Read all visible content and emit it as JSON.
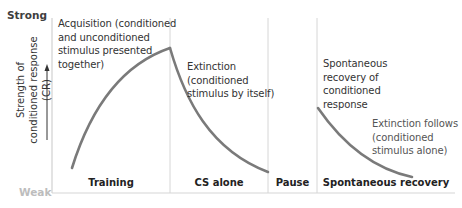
{
  "axis": {
    "top_label": "Strong",
    "bottom_label": "Weak",
    "y_label_line1": "Strength of",
    "y_label_line2": "conditioned response (CR)"
  },
  "phases": [
    {
      "label": "Training",
      "annotation": "Acquisition (conditioned and unconditioned stimulus presented together)"
    },
    {
      "label": "CS alone",
      "annotation": "Extinction (conditioned stimulus by itself)"
    },
    {
      "label": "Pause",
      "annotation": ""
    },
    {
      "label": "Spontaneous recovery",
      "annotation": "Spontaneous recovery of conditioned response"
    }
  ],
  "annotations": {
    "acquisition": [
      "Acquisition (conditioned",
      "and unconditioned",
      "stimulus presented",
      "together)"
    ],
    "extinction": [
      "Extinction",
      "(conditioned",
      "stimulus by itself)"
    ],
    "spontaneous": [
      "Spontaneous",
      "recovery of",
      "conditioned",
      "response"
    ],
    "extinction_follows": [
      "Extinction follows",
      "(conditioned",
      "stimulus alone)"
    ]
  },
  "colors": {
    "curve": "#7a7a7a",
    "divider": "#d4d4d4",
    "axis": "#cfcfcf",
    "strong_text": "#3e3e3e",
    "weak_text": "#bdbdbd"
  }
}
